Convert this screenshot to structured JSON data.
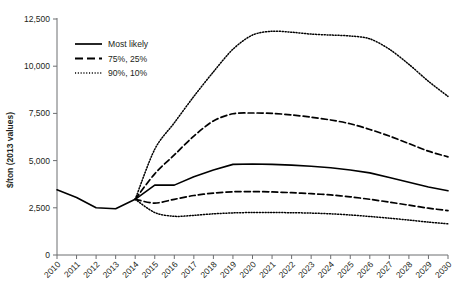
{
  "chart_data": {
    "type": "line",
    "title": "",
    "xlabel": "",
    "ylabel": "$/ton (2013 values)",
    "ylim": [
      0,
      12500
    ],
    "yticks": [
      0,
      2500,
      5000,
      7500,
      10000,
      12500
    ],
    "ytick_labels": [
      "0",
      "2,500",
      "5,000",
      "7,500",
      "10,000",
      "12,500"
    ],
    "grid": false,
    "legend_position": "upper-left",
    "x": [
      2010,
      2011,
      2012,
      2013,
      2014,
      2015,
      2016,
      2017,
      2018,
      2019,
      2020,
      2021,
      2022,
      2023,
      2024,
      2025,
      2026,
      2027,
      2028,
      2029,
      2030
    ],
    "xtick_labels": [
      "2010",
      "2011",
      "2012",
      "2013",
      "2014",
      "2015",
      "2016",
      "2017",
      "2018",
      "2019",
      "2020",
      "2021",
      "2022",
      "2023",
      "2024",
      "2025",
      "2026",
      "2027",
      "2028",
      "2029",
      "2030"
    ],
    "series": [
      {
        "name": "Historical",
        "style": "solid",
        "x": [
          2010,
          2011,
          2012,
          2013,
          2014
        ],
        "values": [
          3450,
          3050,
          2500,
          2450,
          2950
        ]
      },
      {
        "name": "Most likely",
        "style": "solid",
        "x": [
          2014,
          2015,
          2016,
          2017,
          2018,
          2019,
          2020,
          2021,
          2022,
          2023,
          2024,
          2025,
          2026,
          2027,
          2028,
          2029,
          2030
        ],
        "values": [
          2950,
          3700,
          3700,
          4150,
          4500,
          4800,
          4820,
          4800,
          4760,
          4700,
          4620,
          4500,
          4350,
          4100,
          3850,
          3600,
          3400
        ]
      },
      {
        "name": "75%",
        "style": "dashed",
        "x": [
          2014,
          2015,
          2016,
          2017,
          2018,
          2019,
          2020,
          2021,
          2022,
          2023,
          2024,
          2025,
          2026,
          2027,
          2028,
          2029,
          2030
        ],
        "values": [
          2950,
          4300,
          5300,
          6300,
          7100,
          7480,
          7520,
          7500,
          7420,
          7300,
          7150,
          6950,
          6650,
          6300,
          5900,
          5500,
          5200
        ]
      },
      {
        "name": "25%",
        "style": "dashed",
        "x": [
          2014,
          2015,
          2016,
          2017,
          2018,
          2019,
          2020,
          2021,
          2022,
          2023,
          2024,
          2025,
          2026,
          2027,
          2028,
          2029,
          2030
        ],
        "values": [
          2950,
          2750,
          2950,
          3150,
          3280,
          3350,
          3360,
          3340,
          3300,
          3250,
          3180,
          3080,
          2950,
          2800,
          2640,
          2480,
          2350
        ]
      },
      {
        "name": "90%",
        "style": "dotted",
        "x": [
          2014,
          2015,
          2016,
          2017,
          2018,
          2019,
          2020,
          2021,
          2022,
          2023,
          2024,
          2025,
          2026,
          2027,
          2028,
          2029,
          2030
        ],
        "values": [
          2950,
          5600,
          7000,
          8400,
          9700,
          10900,
          11650,
          11850,
          11800,
          11700,
          11650,
          11600,
          11450,
          10900,
          10100,
          9200,
          8400
        ]
      },
      {
        "name": "10%",
        "style": "dotted",
        "x": [
          2014,
          2015,
          2016,
          2017,
          2018,
          2019,
          2020,
          2021,
          2022,
          2023,
          2024,
          2025,
          2026,
          2027,
          2028,
          2029,
          2030
        ],
        "values": [
          2950,
          2250,
          2050,
          2100,
          2180,
          2230,
          2250,
          2250,
          2240,
          2220,
          2180,
          2120,
          2040,
          1950,
          1850,
          1740,
          1650
        ]
      }
    ],
    "legend": [
      {
        "label": "Most likely",
        "style": "solid"
      },
      {
        "label": "75%, 25%",
        "style": "dashed"
      },
      {
        "label": "90%, 10%",
        "style": "dotted"
      }
    ]
  }
}
